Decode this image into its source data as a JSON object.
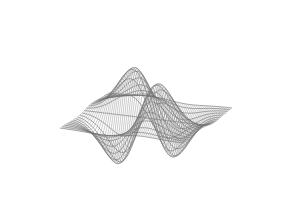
{
  "chart_data": {
    "type": "surface",
    "title": "",
    "xlabel": "",
    "ylabel": "",
    "zlabel": "",
    "style": "wireframe",
    "function": "z = x * y * exp(-(x^2 + y^2))",
    "x_range": [
      -2.2,
      2.2
    ],
    "y_range": [
      -2.2,
      2.2
    ],
    "grid": {
      "x_lines": 64,
      "y_lines": 22
    },
    "features": {
      "peaks": 2,
      "troughs": 2,
      "peak_screen_positions": [
        [
          128,
          33
        ],
        [
          160,
          16
        ]
      ],
      "trough_screen_positions": [
        [
          115,
          200
        ],
        [
          175,
          212
        ]
      ]
    },
    "axes_visible": false,
    "legend": null
  },
  "render": {
    "line_color": "#8a8a8a",
    "contour_color": "#707070",
    "background": "#ffffff",
    "projection": {
      "origin": [
        146,
        118
      ],
      "x_axis": [
        28,
        3.4
      ],
      "y_axis": [
        -11,
        8
      ],
      "z_scale": -230
    }
  }
}
